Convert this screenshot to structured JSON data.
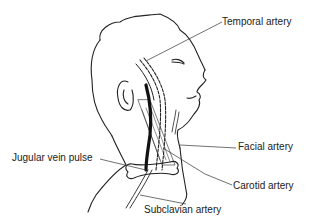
{
  "diagram": {
    "labels": [
      {
        "id": "temporal",
        "text": "Temporal artery"
      },
      {
        "id": "facial",
        "text": "Facial artery"
      },
      {
        "id": "jugular",
        "text": "Jugular vein pulse"
      },
      {
        "id": "carotid",
        "text": "Carotid artery"
      },
      {
        "id": "subclavian",
        "text": "Subclavian artery"
      }
    ]
  }
}
